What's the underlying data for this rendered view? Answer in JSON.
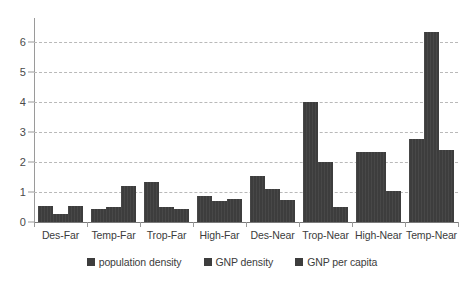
{
  "chart_data": {
    "type": "bar",
    "title": "",
    "xlabel": "",
    "ylabel": "",
    "ylim": [
      0,
      6.6
    ],
    "yticks": [
      0,
      1,
      2,
      3,
      4,
      5,
      6
    ],
    "ytick_labels": [
      "0",
      "1",
      "2",
      "3",
      "4",
      "5",
      "6"
    ],
    "grid": true,
    "legend_position": "bottom",
    "bar_color": "#3d3d3d",
    "categories": [
      "Des-Far",
      "Temp-Far",
      "Trop-Far",
      "High-Far",
      "Des-Near",
      "Trop-Near",
      "High-Near",
      "Temp-Near"
    ],
    "series": [
      {
        "name": "population density",
        "values": [
          0.52,
          0.42,
          1.33,
          0.88,
          1.52,
          4.0,
          2.32,
          2.78
        ]
      },
      {
        "name": "GNP density",
        "values": [
          0.27,
          0.5,
          0.5,
          0.7,
          1.1,
          2.0,
          2.32,
          6.35
        ]
      },
      {
        "name": "GNP per capita",
        "values": [
          0.52,
          1.2,
          0.42,
          0.77,
          0.75,
          0.5,
          1.05,
          2.4
        ]
      }
    ]
  }
}
